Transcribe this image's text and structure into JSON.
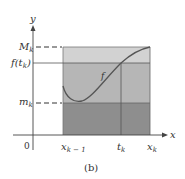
{
  "figure": {
    "caption": "(b)",
    "axes": {
      "x_label": "x",
      "y_label": "y",
      "origin_label": "0"
    },
    "y_levels": {
      "M_k": {
        "base": "M",
        "sub": "k"
      },
      "f_t_k": {
        "prefix": "f(t",
        "sub": "k",
        "suffix": ")"
      },
      "m_k": {
        "base": "m",
        "sub": "k"
      }
    },
    "x_marks": {
      "x_k_minus_1": {
        "base": "x",
        "sub": "k − 1"
      },
      "t_k": {
        "base": "t",
        "sub": "k"
      },
      "x_k": {
        "base": "x",
        "sub": "k"
      }
    },
    "curve_label": "f",
    "colors": {
      "upper_band": "#d2d2d2",
      "middle_band": "#b6b6b6",
      "lower_band": "#8e8e8e",
      "line": "#555555"
    }
  }
}
